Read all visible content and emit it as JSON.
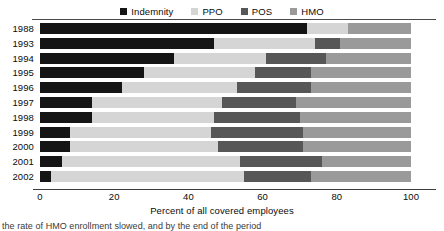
{
  "chart_data": {
    "type": "bar",
    "orientation": "horizontal",
    "stacked": true,
    "title": "",
    "xlabel": "Percent of all covered employees",
    "ylabel": "",
    "xlim": [
      0,
      100
    ],
    "xticks": [
      0,
      20,
      40,
      60,
      80,
      100
    ],
    "grid": false,
    "legend_position": "top-center",
    "categories": [
      "1988",
      "1993",
      "1994",
      "1995",
      "1996",
      "1997",
      "1998",
      "1999",
      "2000",
      "2001",
      "2002"
    ],
    "series": [
      {
        "name": "Indemnity",
        "color": "#151515",
        "values": [
          72,
          47,
          36,
          28,
          22,
          14,
          14,
          8,
          8,
          6,
          3
        ]
      },
      {
        "name": "PPO",
        "color": "#d5d5d5",
        "values": [
          11,
          27,
          25,
          30,
          31,
          35,
          33,
          38,
          40,
          48,
          52
        ]
      },
      {
        "name": "POS",
        "color": "#575757",
        "values": [
          0,
          7,
          16,
          15,
          20,
          20,
          23,
          25,
          23,
          22,
          18
        ]
      },
      {
        "name": "HMO",
        "color": "#9a9a9a",
        "values": [
          17,
          19,
          23,
          27,
          27,
          31,
          30,
          29,
          29,
          24,
          27
        ]
      }
    ]
  },
  "legend": {
    "items": [
      {
        "label": "Indemnity",
        "color": "#151515"
      },
      {
        "label": "PPO",
        "color": "#d5d5d5"
      },
      {
        "label": "POS",
        "color": "#575757"
      },
      {
        "label": "HMO",
        "color": "#9a9a9a"
      }
    ]
  },
  "footnote": {
    "text": "the rate of HMO enrollment slowed, and by the end of the period"
  }
}
